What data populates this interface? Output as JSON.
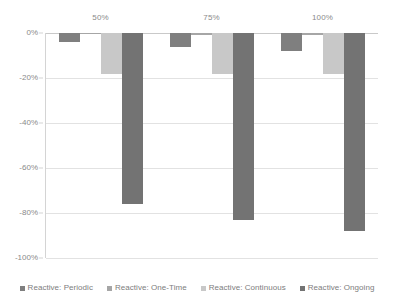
{
  "chart_data": {
    "type": "bar",
    "title": "",
    "subtitle": "",
    "xlabel": "",
    "ylabel": "",
    "categories": [
      "50%",
      "75%",
      "100%"
    ],
    "series": [
      {
        "name": "Reactive: Periodic",
        "color": "#7f7f7f",
        "values": [
          -4,
          -6,
          -8
        ]
      },
      {
        "name": "Reactive: One-Time",
        "color": "#a6a6a6",
        "values": [
          -0.5,
          -1,
          -1
        ]
      },
      {
        "name": "Reactive: Continuous",
        "color": "#c8c8c8",
        "values": [
          -18,
          -18,
          -18
        ]
      },
      {
        "name": "Reactive: Ongoing",
        "color": "#737373",
        "values": [
          -76,
          -83,
          -88
        ]
      }
    ],
    "ylim": [
      -100,
      0
    ],
    "ytick_values": [
      0,
      -20,
      -40,
      -60,
      -80,
      -100
    ],
    "ytick_labels": [
      "0%",
      "-20%",
      "-40%",
      "-60%",
      "-80%",
      "-100%"
    ],
    "grid": true,
    "legend_position": "bottom",
    "category_axis_position": "top",
    "plot_background": "#ffffff",
    "gridline_color": "#e2e2e2",
    "axis_color": "#d4d4d4",
    "text_color": "#8a8a8a"
  }
}
